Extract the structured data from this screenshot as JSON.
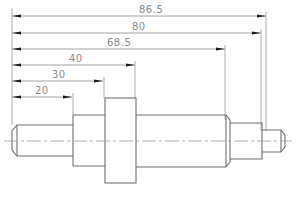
{
  "drawing": {
    "type": "shaft-technical-drawing",
    "units": "mm",
    "dimensions": [
      {
        "label": "86.5",
        "value": 86.5,
        "y": 16,
        "x_end": 266
      },
      {
        "label": "80",
        "value": 80,
        "y": 33,
        "x_end": 261
      },
      {
        "label": "68.5",
        "value": 68.5,
        "y": 49,
        "x_end": 225
      },
      {
        "label": "40",
        "value": 40,
        "y": 65,
        "x_end": 135
      },
      {
        "label": "30",
        "value": 30,
        "y": 81,
        "x_end": 103
      },
      {
        "label": "20",
        "value": 20,
        "y": 97,
        "x_end": 72
      }
    ],
    "datum_x": 12,
    "centerline_y": 141,
    "colors": {
      "outline": "#6e6e6e",
      "dimension": "#8c8c8c",
      "text": "#8a8a8a",
      "arrow": "#1a1a1a",
      "background": "#ffffff"
    }
  }
}
